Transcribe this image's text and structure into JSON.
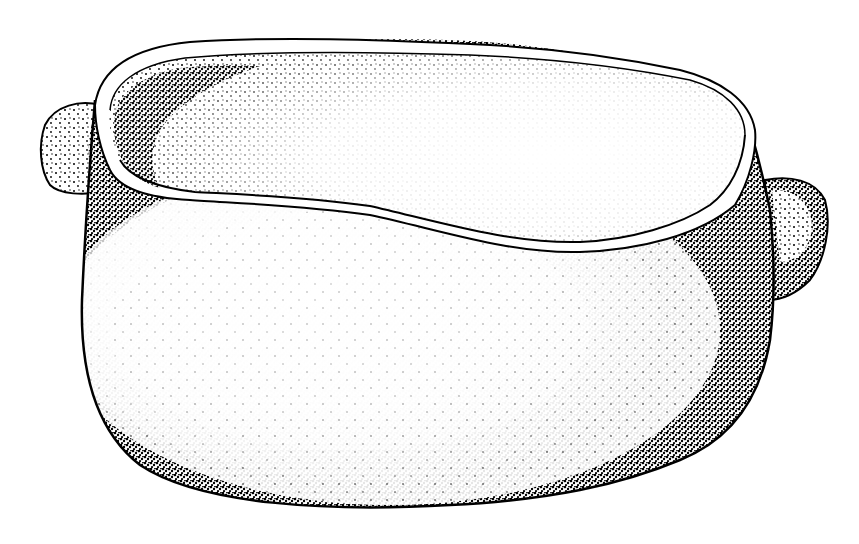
{
  "illustration": {
    "subject": "stone vessel with two lug handles",
    "style": "black ink stipple drawing",
    "colors": {
      "ink": "#000000",
      "paper": "#ffffff"
    }
  }
}
